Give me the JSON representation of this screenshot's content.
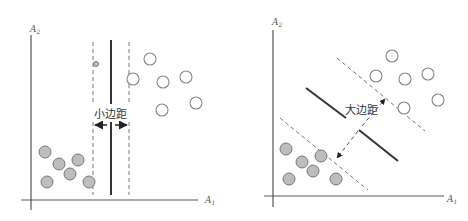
{
  "panels": [
    {
      "id": "small-margin",
      "x_axis_label": "A",
      "x_axis_sub": "1",
      "y_axis_label": "A",
      "y_axis_sub": "2",
      "margin_label": "小边距",
      "positive_points": [
        [
          45,
          152
        ],
        [
          59,
          164
        ],
        [
          70,
          174
        ],
        [
          78,
          160
        ],
        [
          46,
          182
        ],
        [
          89,
          182
        ]
      ],
      "negative_points": [
        [
          150,
          59
        ],
        [
          133,
          79
        ],
        [
          163,
          82
        ],
        [
          186,
          77
        ],
        [
          196,
          103
        ],
        [
          162,
          110
        ]
      ],
      "support_point": [
        96,
        64
      ]
    },
    {
      "id": "large-margin",
      "x_axis_label": "A",
      "x_axis_sub": "1",
      "y_axis_label": "A",
      "y_axis_sub": "2",
      "margin_label": "大边距",
      "positive_points": [
        [
          286,
          149
        ],
        [
          302,
          162
        ],
        [
          321,
          156
        ],
        [
          313,
          171
        ],
        [
          289,
          179
        ],
        [
          336,
          179
        ]
      ],
      "negative_points": [
        [
          392,
          56
        ],
        [
          376,
          76
        ],
        [
          405,
          79
        ],
        [
          428,
          74
        ],
        [
          438,
          100
        ],
        [
          404,
          108
        ]
      ]
    }
  ],
  "colors": {
    "positive_fill": "#bdbdbd",
    "negative_fill": "#ffffff",
    "line": "#333333",
    "dash": "#777777"
  }
}
